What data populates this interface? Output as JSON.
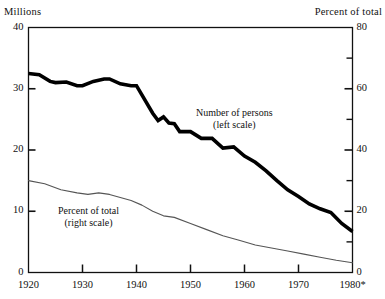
{
  "axes": {
    "left_unit_label": "Millions",
    "right_unit_label": "Percent of total",
    "left_ticks": [
      "0",
      "10",
      "20",
      "30",
      "40"
    ],
    "right_ticks": [
      "0",
      "20",
      "40",
      "60",
      "80"
    ],
    "x_ticks": [
      "1920",
      "1930",
      "1940",
      "1950",
      "1960",
      "1970",
      "1980*"
    ]
  },
  "annotations": {
    "persons_line1": "Number of persons",
    "persons_line2": "(left scale)",
    "percent_line1": "Percent of total",
    "percent_line2": "(right scale)"
  },
  "colors": {
    "ink": "#111111",
    "thick_series": "#000000",
    "thin_series": "#555555",
    "background": "#ffffff"
  },
  "chart_data": {
    "type": "line",
    "title": "",
    "xlabel": "",
    "ylabel": "Millions",
    "y2label": "Percent of total",
    "xlim": [
      1920,
      1980
    ],
    "ylim": [
      0,
      40
    ],
    "y2lim": [
      0,
      80
    ],
    "grid": false,
    "legend": "inline-annotations",
    "x_tick_values": [
      1920,
      1930,
      1940,
      1950,
      1960,
      1970,
      1980
    ],
    "y_tick_values": [
      0,
      10,
      20,
      30,
      40
    ],
    "y2_tick_values": [
      0,
      20,
      40,
      60,
      80
    ],
    "y2_minor_tick_values": [
      10,
      30,
      50,
      70
    ],
    "note": "1980 value marked with an asterisk",
    "series": [
      {
        "name": "Number of persons (left scale)",
        "axis": "left",
        "units": "millions",
        "style": "thick",
        "x": [
          1920,
          1922,
          1924,
          1925,
          1927,
          1929,
          1930,
          1932,
          1934,
          1935,
          1937,
          1939,
          1940,
          1941,
          1943,
          1944,
          1945,
          1946,
          1947,
          1948,
          1950,
          1952,
          1954,
          1956,
          1958,
          1960,
          1962,
          1964,
          1966,
          1968,
          1970,
          1972,
          1974,
          1976,
          1978,
          1980
        ],
        "values": [
          32.5,
          32.3,
          31.2,
          31.0,
          31.1,
          30.5,
          30.5,
          31.2,
          31.6,
          31.6,
          30.8,
          30.5,
          30.5,
          29.0,
          26.0,
          24.8,
          25.4,
          24.4,
          24.3,
          23.0,
          23.0,
          21.9,
          21.9,
          20.3,
          20.5,
          19.0,
          18.0,
          16.6,
          15.0,
          13.5,
          12.4,
          11.2,
          10.4,
          9.8,
          8.0,
          6.7
        ]
      },
      {
        "name": "Percent of total (right scale)",
        "axis": "right",
        "units": "percent",
        "style": "thin",
        "x": [
          1920,
          1923,
          1926,
          1929,
          1931,
          1933,
          1935,
          1937,
          1939,
          1941,
          1943,
          1945,
          1947,
          1950,
          1953,
          1956,
          1959,
          1962,
          1965,
          1968,
          1971,
          1974,
          1977,
          1980
        ],
        "values": [
          30.0,
          29.0,
          27.0,
          26.0,
          25.5,
          26.0,
          25.5,
          24.5,
          23.5,
          22.0,
          20.0,
          18.5,
          18.0,
          16.0,
          14.0,
          12.0,
          10.5,
          9.0,
          8.0,
          7.0,
          6.0,
          5.0,
          4.0,
          3.2
        ]
      }
    ]
  }
}
